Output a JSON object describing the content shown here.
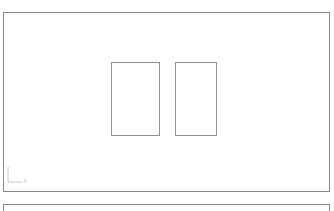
{
  "viewport": {
    "ucs": {
      "y_label": "Y",
      "x_label": "X"
    },
    "shapes": [
      {
        "type": "rectangle",
        "x": 107,
        "y": 49,
        "w": 49,
        "h": 74
      },
      {
        "type": "rectangle",
        "x": 171,
        "y": 49,
        "w": 42,
        "h": 74
      }
    ]
  },
  "command_line": {
    "text": ""
  },
  "colors": {
    "line": "#8f8f8f",
    "background": "#ffffff"
  }
}
